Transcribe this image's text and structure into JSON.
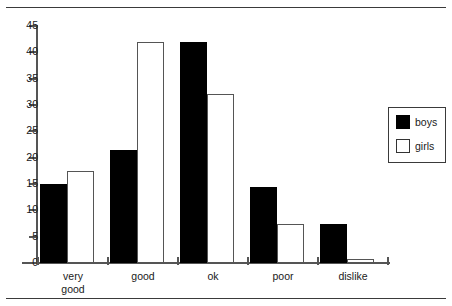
{
  "chart_data": {
    "type": "bar",
    "title": "",
    "xlabel": "",
    "ylabel": "",
    "categories": [
      "very\ngood",
      "good",
      "ok",
      "poor",
      "dislike"
    ],
    "category_labels_flat": [
      "very good",
      "good",
      "ok",
      "poor",
      "dislike"
    ],
    "series": [
      {
        "name": "boys",
        "color": "#000000",
        "fill": "solid",
        "values": [
          15,
          21.5,
          42,
          14.5,
          7.5
        ]
      },
      {
        "name": "girls",
        "color": "#ffffff",
        "fill": "outline",
        "values": [
          17.5,
          42,
          32,
          7.5,
          0.8
        ]
      }
    ],
    "ylim": [
      0,
      45
    ],
    "yticks": [
      0,
      5,
      10,
      15,
      20,
      25,
      30,
      35,
      40,
      45
    ],
    "ytick_labels": [
      "0",
      "5",
      "10",
      "15",
      "20",
      "25",
      "30",
      "35",
      "40",
      "45"
    ],
    "grid": false,
    "legend_position": "right",
    "legend_entries": [
      "boys",
      "girls"
    ]
  },
  "legend": {
    "entries": [
      {
        "label": "boys",
        "swatch": "filled-black-square"
      },
      {
        "label": "girls",
        "swatch": "outlined-white-square"
      }
    ]
  },
  "axis": {
    "y_labels": [
      "45",
      "40",
      "35",
      "30",
      "25",
      "20",
      "15",
      "10",
      "5",
      "0"
    ],
    "y_values": [
      45,
      40,
      35,
      30,
      25,
      20,
      15,
      10,
      5,
      0
    ]
  }
}
